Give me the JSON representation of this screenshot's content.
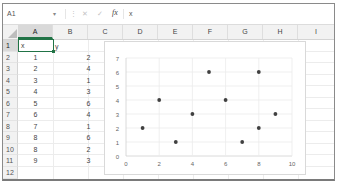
{
  "formula_bar": {
    "name_box": "A1",
    "name_box_arrow": "▾",
    "icons": {
      "more": "⋮",
      "cancel": "✕",
      "enter": "✓"
    },
    "fx_label": "fx",
    "value": "x"
  },
  "columns": [
    "A",
    "B",
    "C",
    "D",
    "E",
    "F",
    "G",
    "H",
    "I"
  ],
  "selected_column": "A",
  "rows": [
    "1",
    "2",
    "3",
    "4",
    "5",
    "6",
    "7",
    "8",
    "9",
    "10",
    "11",
    "12"
  ],
  "selected_row": "1",
  "active_cell": "A1",
  "cells": {
    "A1": "x",
    "B1": "y",
    "A": [
      "1",
      "2",
      "3",
      "4",
      "5",
      "6",
      "7",
      "8",
      "8",
      "9"
    ],
    "B": [
      "2",
      "4",
      "1",
      "3",
      "6",
      "4",
      "1",
      "6",
      "2",
      "3"
    ]
  },
  "chart_data": {
    "type": "scatter",
    "title": "",
    "xlabel": "",
    "ylabel": "",
    "x": [
      1,
      2,
      3,
      4,
      5,
      6,
      7,
      8,
      8,
      9
    ],
    "y": [
      2,
      4,
      1,
      3,
      6,
      4,
      1,
      6,
      2,
      3
    ],
    "xlim": [
      0,
      10
    ],
    "ylim": [
      0,
      7
    ],
    "x_ticks": [
      "0",
      "2",
      "4",
      "6",
      "8",
      "10"
    ],
    "y_ticks": [
      "0",
      "1",
      "2",
      "3",
      "4",
      "5",
      "6",
      "7"
    ],
    "grid": true,
    "legend": false,
    "marker_color": "#404040"
  }
}
